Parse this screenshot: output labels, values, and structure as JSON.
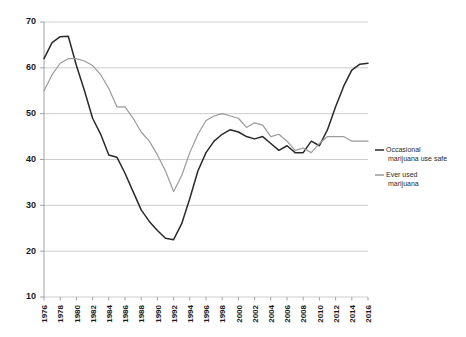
{
  "chart_data": {
    "type": "line",
    "title": "",
    "xlabel": "",
    "ylabel": "",
    "ylim": [
      10,
      70
    ],
    "ytick_step": 10,
    "yticks": [
      10,
      20,
      30,
      40,
      50,
      60,
      70
    ],
    "grid": true,
    "legend_position": "right",
    "x": [
      1976,
      1977,
      1978,
      1979,
      1980,
      1981,
      1982,
      1983,
      1984,
      1985,
      1986,
      1987,
      1988,
      1989,
      1990,
      1991,
      1992,
      1993,
      1994,
      1995,
      1996,
      1997,
      1998,
      1999,
      2000,
      2001,
      2002,
      2003,
      2004,
      2005,
      2006,
      2007,
      2008,
      2009,
      2010,
      2011,
      2012,
      2013,
      2014,
      2015,
      2016
    ],
    "xtick_labels": [
      "1976",
      "1978",
      "1980",
      "1982",
      "1984",
      "1986",
      "1988",
      "1990",
      "1992",
      "1994",
      "1996",
      "1998",
      "2000",
      "2002",
      "2004",
      "2006",
      "2008",
      "2010",
      "2012",
      "2014",
      "2016"
    ],
    "series": [
      {
        "name": "Occasional marijuana use safe",
        "color": "#2a2a2a",
        "values": [
          62.0,
          65.5,
          66.8,
          66.9,
          60.5,
          55.0,
          49.0,
          45.5,
          41.0,
          40.5,
          37.0,
          33.0,
          29.0,
          26.5,
          24.5,
          22.8,
          22.5,
          26.0,
          31.5,
          37.5,
          41.5,
          44.0,
          45.5,
          46.5,
          46.0,
          45.0,
          44.5,
          45.0,
          43.5,
          42.0,
          43.0,
          41.5,
          41.5,
          44.0,
          43.0,
          46.5,
          51.5,
          56.0,
          59.5,
          60.8,
          61.0
        ]
      },
      {
        "name": "Ever used marijuana",
        "color": "#9a9a9a",
        "values": [
          55.0,
          58.5,
          61.0,
          62.0,
          62.0,
          61.5,
          60.5,
          58.5,
          55.5,
          51.5,
          51.5,
          49.0,
          46.0,
          44.0,
          41.0,
          37.5,
          33.0,
          36.5,
          41.5,
          45.5,
          48.5,
          49.5,
          50.0,
          49.5,
          49.0,
          47.0,
          48.0,
          47.5,
          45.0,
          45.5,
          44.0,
          42.0,
          42.5,
          41.5,
          43.5,
          45.0,
          45.0,
          45.0,
          44.0,
          44.0,
          44.0
        ]
      }
    ]
  },
  "legend": {
    "items": [
      {
        "label_line1": "Occasional",
        "label_line2": "marijuana use safe",
        "color": "#2a2a2a"
      },
      {
        "label_line1": "Ever used",
        "label_line2": "marijuana",
        "color": "#9a9a9a"
      }
    ]
  }
}
